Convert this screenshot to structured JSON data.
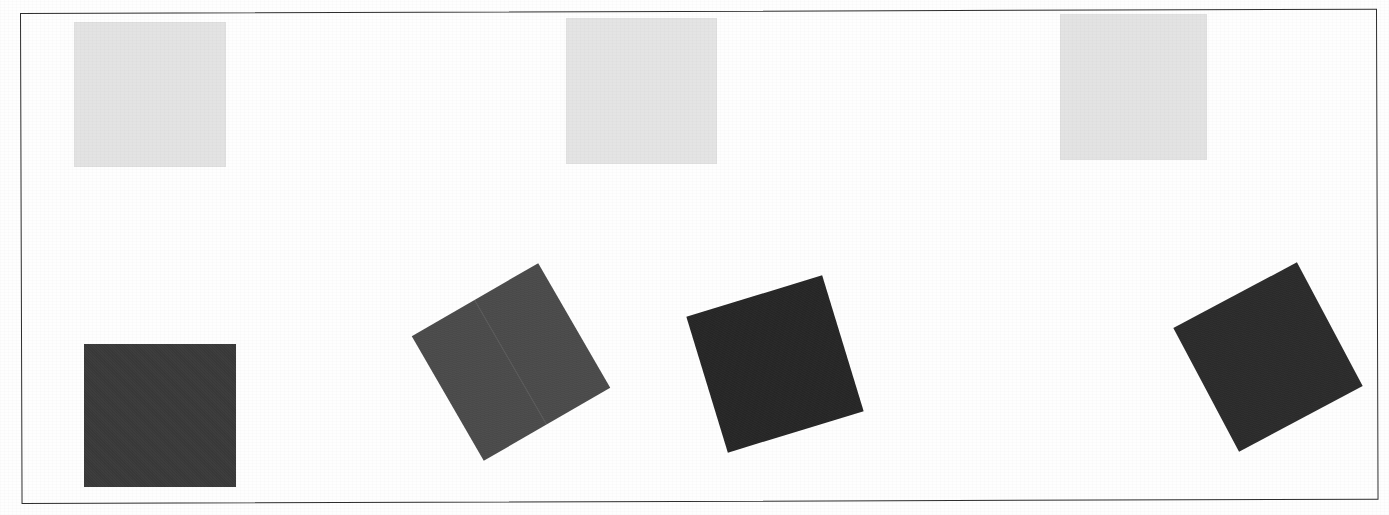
{
  "page": {
    "width": 1389,
    "height": 515,
    "background_color": "#fefefe",
    "media": "scanned-document-figure"
  },
  "frame": {
    "name": "figure-border",
    "x": 20,
    "y": 13,
    "width": 1357,
    "height": 491,
    "stroke_color": "#2e2e2e",
    "stroke_width": 1.6,
    "skew_deg": -0.18
  },
  "shapes": {
    "count": 7,
    "rows": [
      {
        "row_label": "top-row-light-squares",
        "count": 3,
        "fill": "#e3e3e3",
        "items": [
          {
            "id": "light-square-1",
            "x": 74,
            "y": 22,
            "width": 152,
            "height": 145,
            "rotation_deg": 0,
            "fill": "#e3e3e3"
          },
          {
            "id": "light-square-2",
            "x": 566,
            "y": 18,
            "width": 151,
            "height": 146,
            "rotation_deg": 0,
            "fill": "#e4e4e4"
          },
          {
            "id": "light-square-3",
            "x": 1060,
            "y": 14,
            "width": 147,
            "height": 146,
            "rotation_deg": 0,
            "fill": "#e3e3e3"
          }
        ]
      },
      {
        "row_label": "bottom-row-dark-squares",
        "count": 4,
        "items": [
          {
            "id": "dark-square-1",
            "x": 84,
            "y": 344,
            "width": 152,
            "height": 143,
            "rotation_deg": 0,
            "fill": "#3a3a3a",
            "has_seam": false
          },
          {
            "id": "dark-square-2",
            "x": 438,
            "y": 290,
            "width": 146,
            "height": 144,
            "rotation_deg": -30,
            "fill": "#4b4b4b",
            "has_seam": true
          },
          {
            "id": "dark-square-3",
            "x": 704,
            "y": 293,
            "width": 142,
            "height": 142,
            "rotation_deg": -17,
            "fill": "#262626",
            "has_seam": false
          },
          {
            "id": "dark-square-4",
            "x": 1198,
            "y": 287,
            "width": 140,
            "height": 140,
            "rotation_deg": -28,
            "fill": "#2b2b2b",
            "has_seam": false
          }
        ]
      }
    ]
  },
  "colors": {
    "paper": "#fefefe",
    "frame_stroke": "#2e2e2e",
    "light_fill": "#e3e3e3",
    "dark_fill_light": "#4b4b4b",
    "dark_fill_mid": "#3a3a3a",
    "dark_fill_deep": "#262626"
  }
}
